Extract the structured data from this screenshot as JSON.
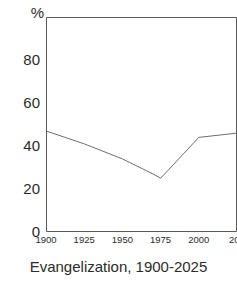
{
  "figure": {
    "caption": "Evangelization, 1900-2025",
    "y_unit": "%",
    "line_color": "#6e6e6e",
    "axis_color": "#5a5a5a",
    "background": "#ffffff"
  },
  "chart_data": {
    "type": "line",
    "title": "Evangelization, 1900-2025",
    "xlabel": "",
    "ylabel": "%",
    "ylim": [
      0,
      100
    ],
    "xlim": [
      1900,
      2025
    ],
    "grid": false,
    "legend": null,
    "y_ticks": [
      0,
      20,
      40,
      60,
      80
    ],
    "y_tick_labels": [
      "0",
      "20",
      "40",
      "60",
      "80"
    ],
    "x_ticks": [
      1900,
      1925,
      1950,
      1975,
      2000,
      2025
    ],
    "x_tick_labels": [
      "1900",
      "1925",
      "1950",
      "1975",
      "2000",
      "202"
    ],
    "x": [
      1900,
      1925,
      1950,
      1970,
      1975,
      2000,
      2025
    ],
    "values": [
      47,
      41,
      34,
      27,
      25,
      44,
      46
    ],
    "series": [
      {
        "name": "Evangelization",
        "x": [
          1900,
          1925,
          1950,
          1970,
          1975,
          2000,
          2025
        ],
        "values": [
          47,
          41,
          34,
          27,
          25,
          44,
          46
        ]
      }
    ]
  }
}
